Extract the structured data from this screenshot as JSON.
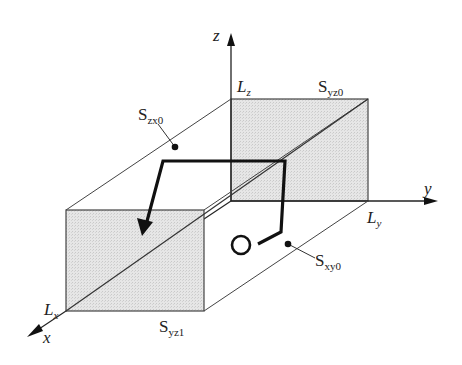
{
  "figure": {
    "type": "3d-box-domain-diagram",
    "axes": {
      "x": {
        "label": "x"
      },
      "y": {
        "label": "y"
      },
      "z": {
        "label": "z"
      }
    },
    "dimensions": {
      "lx": {
        "main": "L",
        "sub": "x"
      },
      "ly": {
        "main": "L",
        "sub": "y"
      },
      "lz": {
        "main": "L",
        "sub": "z"
      }
    },
    "surfaces": {
      "yz0": {
        "main": "S",
        "sub": "yz0",
        "shaded": true
      },
      "yz1": {
        "main": "S",
        "sub": "yz1",
        "shaded": true
      },
      "zx0": {
        "main": "S",
        "sub": "zx0",
        "shaded": false
      },
      "xy0": {
        "main": "S",
        "sub": "xy0",
        "shaded": false
      }
    },
    "path": {
      "description": "Trajectory starting at open circle, ending with arrow into front face",
      "start_marker": "open-circle",
      "end_marker": "arrow"
    },
    "colors": {
      "line": "#333333",
      "face_fill": "#e0e0e0",
      "path": "#111111",
      "background": "#ffffff"
    }
  }
}
